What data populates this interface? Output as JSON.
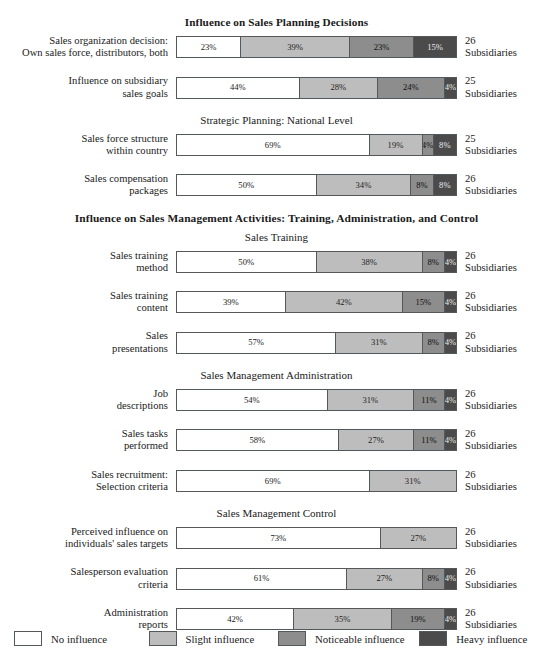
{
  "chart_data": {
    "type": "bar",
    "subtype": "stacked-horizontal-100pct",
    "title": "Influence on Sales Planning Decisions",
    "xlabel": "",
    "ylabel": "",
    "xlim": [
      0,
      100
    ],
    "grid": false,
    "legend_position": "bottom",
    "series": [
      {
        "name": "No influence",
        "color": "#ffffff"
      },
      {
        "name": "Slight influence",
        "color": "#bdbdbd"
      },
      {
        "name": "Noticeable influence",
        "color": "#8d8d8d"
      },
      {
        "name": "Heavy influence",
        "color": "#4b4b4b"
      }
    ],
    "categories": [
      "Sales organization decision: Own sales force, distributors, both",
      "Influence on subsidiary sales goals",
      "Sales force structure within country",
      "Sales compensation packages",
      "Sales training method",
      "Sales training content",
      "Sales presentations",
      "Job descriptions",
      "Sales tasks performed",
      "Sales recruitment: Selection criteria",
      "Perceived influence on individuals' sales targets",
      "Salesperson evaluation criteria",
      "Administration reports"
    ],
    "values": [
      [
        23,
        39,
        23,
        15
      ],
      [
        44,
        28,
        24,
        4
      ],
      [
        69,
        19,
        4,
        8
      ],
      [
        50,
        34,
        8,
        8
      ],
      [
        50,
        38,
        8,
        4
      ],
      [
        39,
        42,
        15,
        4
      ],
      [
        57,
        31,
        8,
        4
      ],
      [
        54,
        31,
        11,
        4
      ],
      [
        58,
        27,
        11,
        4
      ],
      [
        69,
        31,
        0,
        0
      ],
      [
        73,
        27,
        0,
        0
      ],
      [
        61,
        27,
        8,
        4
      ],
      [
        42,
        35,
        19,
        4
      ]
    ],
    "counts": [
      26,
      25,
      25,
      26,
      26,
      26,
      26,
      26,
      26,
      26,
      26,
      26,
      26
    ]
  },
  "sections": [
    {
      "heading": "Influence on Sales Planning Decisions",
      "heading_style": "bold",
      "subheading": "",
      "rows": [
        {
          "label_line1": "Sales organization decision:",
          "label_line2": "Own sales force, distributors, both",
          "segments": [
            {
              "pct": 23,
              "label": "23%",
              "color_key": "c0"
            },
            {
              "pct": 39,
              "label": "39%",
              "color_key": "c1"
            },
            {
              "pct": 23,
              "label": "23%",
              "color_key": "c2"
            },
            {
              "pct": 15,
              "label": "15%",
              "color_key": "c3"
            }
          ],
          "count": "26",
          "count_unit": "Subsidiaries"
        },
        {
          "label_line1": "Influence on subsidiary",
          "label_line2": "sales goals",
          "segments": [
            {
              "pct": 44,
              "label": "44%",
              "color_key": "c0"
            },
            {
              "pct": 28,
              "label": "28%",
              "color_key": "c1"
            },
            {
              "pct": 24,
              "label": "24%",
              "color_key": "c2"
            },
            {
              "pct": 4,
              "label": "4%",
              "color_key": "c3"
            }
          ],
          "count": "25",
          "count_unit": "Subsidiaries"
        }
      ]
    },
    {
      "heading": "",
      "heading_style": "plain",
      "subheading": "Strategic Planning: National Level",
      "rows": [
        {
          "label_line1": "Sales force structure",
          "label_line2": "within country",
          "segments": [
            {
              "pct": 69,
              "label": "69%",
              "color_key": "c0"
            },
            {
              "pct": 19,
              "label": "19%",
              "color_key": "c1"
            },
            {
              "pct": 4,
              "label": "4%",
              "color_key": "c2"
            },
            {
              "pct": 8,
              "label": "8%",
              "color_key": "c3"
            }
          ],
          "count": "25",
          "count_unit": "Subsidiaries"
        },
        {
          "label_line1": "Sales compensation",
          "label_line2": "packages",
          "segments": [
            {
              "pct": 50,
              "label": "50%",
              "color_key": "c0"
            },
            {
              "pct": 34,
              "label": "34%",
              "color_key": "c1"
            },
            {
              "pct": 8,
              "label": "8%",
              "color_key": "c2"
            },
            {
              "pct": 8,
              "label": "8%",
              "color_key": "c3"
            }
          ],
          "count": "26",
          "count_unit": "Subsidiaries"
        }
      ]
    },
    {
      "heading": "Influence on Sales Management Activities: Training, Administration, and Control",
      "heading_style": "bold",
      "subheading": "Sales Training",
      "rows": [
        {
          "label_line1": "Sales training",
          "label_line2": "method",
          "segments": [
            {
              "pct": 50,
              "label": "50%",
              "color_key": "c0"
            },
            {
              "pct": 38,
              "label": "38%",
              "color_key": "c1"
            },
            {
              "pct": 8,
              "label": "8%",
              "color_key": "c2"
            },
            {
              "pct": 4,
              "label": "4%",
              "color_key": "c3"
            }
          ],
          "count": "26",
          "count_unit": "Subsidiaries"
        },
        {
          "label_line1": "Sales training",
          "label_line2": "content",
          "segments": [
            {
              "pct": 39,
              "label": "39%",
              "color_key": "c0"
            },
            {
              "pct": 42,
              "label": "42%",
              "color_key": "c1"
            },
            {
              "pct": 15,
              "label": "15%",
              "color_key": "c2"
            },
            {
              "pct": 4,
              "label": "4%",
              "color_key": "c3"
            }
          ],
          "count": "26",
          "count_unit": "Subsidiaries"
        },
        {
          "label_line1": "Sales",
          "label_line2": "presentations",
          "segments": [
            {
              "pct": 57,
              "label": "57%",
              "color_key": "c0"
            },
            {
              "pct": 31,
              "label": "31%",
              "color_key": "c1"
            },
            {
              "pct": 8,
              "label": "8%",
              "color_key": "c2"
            },
            {
              "pct": 4,
              "label": "4%",
              "color_key": "c3"
            }
          ],
          "count": "26",
          "count_unit": "Subsidiaries"
        }
      ]
    },
    {
      "heading": "",
      "heading_style": "plain",
      "subheading": "Sales Management Administration",
      "rows": [
        {
          "label_line1": "Job",
          "label_line2": "descriptions",
          "segments": [
            {
              "pct": 54,
              "label": "54%",
              "color_key": "c0"
            },
            {
              "pct": 31,
              "label": "31%",
              "color_key": "c1"
            },
            {
              "pct": 11,
              "label": "11%",
              "color_key": "c2"
            },
            {
              "pct": 4,
              "label": "4%",
              "color_key": "c3"
            }
          ],
          "count": "26",
          "count_unit": "Subsidiaries"
        },
        {
          "label_line1": "Sales tasks",
          "label_line2": "performed",
          "segments": [
            {
              "pct": 58,
              "label": "58%",
              "color_key": "c0"
            },
            {
              "pct": 27,
              "label": "27%",
              "color_key": "c1"
            },
            {
              "pct": 11,
              "label": "11%",
              "color_key": "c2"
            },
            {
              "pct": 4,
              "label": "4%",
              "color_key": "c3"
            }
          ],
          "count": "26",
          "count_unit": "Subsidiaries"
        },
        {
          "label_line1": "Sales recruitment:",
          "label_line2": "Selection criteria",
          "segments": [
            {
              "pct": 69,
              "label": "69%",
              "color_key": "c0"
            },
            {
              "pct": 31,
              "label": "31%",
              "color_key": "c1"
            }
          ],
          "count": "26",
          "count_unit": "Subsidiaries"
        }
      ]
    },
    {
      "heading": "",
      "heading_style": "plain",
      "subheading": "Sales Management Control",
      "rows": [
        {
          "label_line1": "Perceived influence on",
          "label_line2": "individuals' sales targets",
          "segments": [
            {
              "pct": 73,
              "label": "73%",
              "color_key": "c0"
            },
            {
              "pct": 27,
              "label": "27%",
              "color_key": "c1"
            }
          ],
          "count": "26",
          "count_unit": "Subsidiaries"
        },
        {
          "label_line1": "Salesperson evaluation",
          "label_line2": "criteria",
          "segments": [
            {
              "pct": 61,
              "label": "61%",
              "color_key": "c0"
            },
            {
              "pct": 27,
              "label": "27%",
              "color_key": "c1"
            },
            {
              "pct": 8,
              "label": "8%",
              "color_key": "c2"
            },
            {
              "pct": 4,
              "label": "4%",
              "color_key": "c3"
            }
          ],
          "count": "26",
          "count_unit": "Subsidiaries"
        },
        {
          "label_line1": "Administration",
          "label_line2": "reports",
          "segments": [
            {
              "pct": 42,
              "label": "42%",
              "color_key": "c0"
            },
            {
              "pct": 35,
              "label": "35%",
              "color_key": "c1"
            },
            {
              "pct": 19,
              "label": "19%",
              "color_key": "c2"
            },
            {
              "pct": 4,
              "label": "4%",
              "color_key": "c3"
            }
          ],
          "count": "26",
          "count_unit": "Subsidiaries"
        }
      ]
    }
  ],
  "legend": {
    "items": [
      {
        "label": "No influence",
        "color_key": "c0",
        "color": "#ffffff"
      },
      {
        "label": "Slight influence",
        "color_key": "c1",
        "color": "#bdbdbd"
      },
      {
        "label": "Noticeable influence",
        "color_key": "c2",
        "color": "#8d8d8d"
      },
      {
        "label": "Heavy influence",
        "color_key": "c3",
        "color": "#4b4b4b"
      }
    ]
  }
}
